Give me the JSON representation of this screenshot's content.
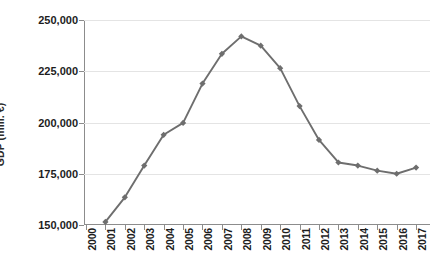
{
  "chart_data": {
    "type": "line",
    "title": "",
    "xlabel": "",
    "ylabel": "GDP (mill. €)",
    "categories": [
      "2000",
      "2001",
      "2002",
      "2003",
      "2004",
      "2005",
      "2006",
      "2007",
      "2008",
      "2009",
      "2010",
      "2011",
      "2012",
      "2013",
      "2014",
      "2015",
      "2016",
      "2017"
    ],
    "x": [
      2000,
      2001,
      2002,
      2003,
      2004,
      2005,
      2006,
      2007,
      2008,
      2009,
      2010,
      2011,
      2012,
      2013,
      2014,
      2015,
      2016,
      2017
    ],
    "values": [
      null,
      151500,
      163500,
      179000,
      194000,
      199800,
      219000,
      233500,
      242000,
      237500,
      226500,
      208000,
      191500,
      180500,
      179000,
      176500,
      175000,
      178000
    ],
    "series": [
      {
        "name": "GDP",
        "color": "#6e6e6e",
        "marker": "diamond",
        "values": [
          null,
          151500,
          163500,
          179000,
          194000,
          199800,
          219000,
          233500,
          242000,
          237500,
          226500,
          208000,
          191500,
          180500,
          179000,
          176500,
          175000,
          178000
        ]
      }
    ],
    "ylim": [
      150000,
      250000
    ],
    "yticks": [
      150000,
      175000,
      200000,
      225000,
      250000
    ],
    "ytick_labels": [
      "150,000",
      "175,000",
      "200,000",
      "225,000",
      "250,000"
    ],
    "xtick_labels": [
      "2000",
      "2001",
      "2002",
      "2003",
      "2004",
      "2005",
      "2006",
      "2007",
      "2008",
      "2009",
      "2010",
      "2011",
      "2012",
      "2013",
      "2014",
      "2015",
      "2016",
      "2017"
    ],
    "grid": true,
    "grid_axis": "y",
    "legend": false,
    "legend_position": "none",
    "xtick_rotation": 90,
    "axis_color": "#8c8c8c",
    "grid_color": "#e4e4e4",
    "text_color": "#1d1d1d",
    "background": "#ffffff"
  }
}
